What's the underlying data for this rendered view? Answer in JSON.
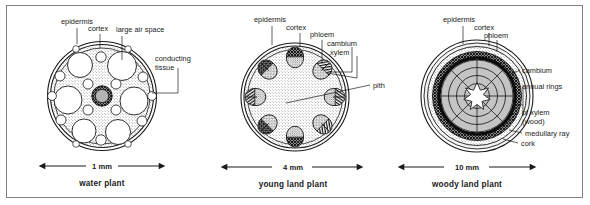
{
  "figure": {
    "background": "#ffffff",
    "frame_color": "#808084",
    "ink_color": "#1a1a1a"
  },
  "panels": [
    {
      "id": "water-plant",
      "caption": "water plant",
      "scale_label": "1 mm",
      "labels": [
        {
          "id": "epidermis",
          "text": "epidermis"
        },
        {
          "id": "cortex",
          "text": "cortex"
        },
        {
          "id": "large-air-space",
          "text": "large air space"
        },
        {
          "id": "conducting-tissue-1",
          "text": "conducting"
        },
        {
          "id": "conducting-tissue-2",
          "text": "tissue"
        }
      ],
      "structure": {
        "epidermis": "outer double ring",
        "cortex": "stippled ground tissue",
        "air_spaces": "large white circular lacunae",
        "conducting_tissue": "small central dark ring with grey core"
      }
    },
    {
      "id": "young-land-plant",
      "caption": "young land plant",
      "scale_label": "4 mm",
      "labels": [
        {
          "id": "epidermis",
          "text": "epidermis"
        },
        {
          "id": "cortex",
          "text": "cortex"
        },
        {
          "id": "phloem",
          "text": "phloem"
        },
        {
          "id": "cambium",
          "text": "cambium"
        },
        {
          "id": "xylem",
          "text": "xylem"
        },
        {
          "id": "pith",
          "text": "pith"
        }
      ],
      "structure": {
        "bundle_count": 8,
        "arrangement": "ring of discrete vascular bundles",
        "pith": "central stippled ground tissue"
      }
    },
    {
      "id": "woody-land-plant",
      "caption": "woody land plant",
      "scale_label": "10 mm",
      "labels": [
        {
          "id": "epidermis",
          "text": "epidermis"
        },
        {
          "id": "cortex",
          "text": "cortex"
        },
        {
          "id": "phloem",
          "text": "phloem"
        },
        {
          "id": "cambium",
          "text": "cambium"
        },
        {
          "id": "annual-rings",
          "text": "annual rings"
        },
        {
          "id": "of-xylem",
          "text": "of xylem"
        },
        {
          "id": "wood",
          "text": "(wood)"
        },
        {
          "id": "medullary-ray",
          "text": "medullary ray"
        },
        {
          "id": "cork",
          "text": "cork"
        }
      ],
      "structure": {
        "annual_ring_count": 3,
        "medullary_ray_count": 8,
        "pith": "white star-shaped centre",
        "cambium": "solid black ring",
        "phloem": "dark cross-hatched ring"
      }
    }
  ]
}
